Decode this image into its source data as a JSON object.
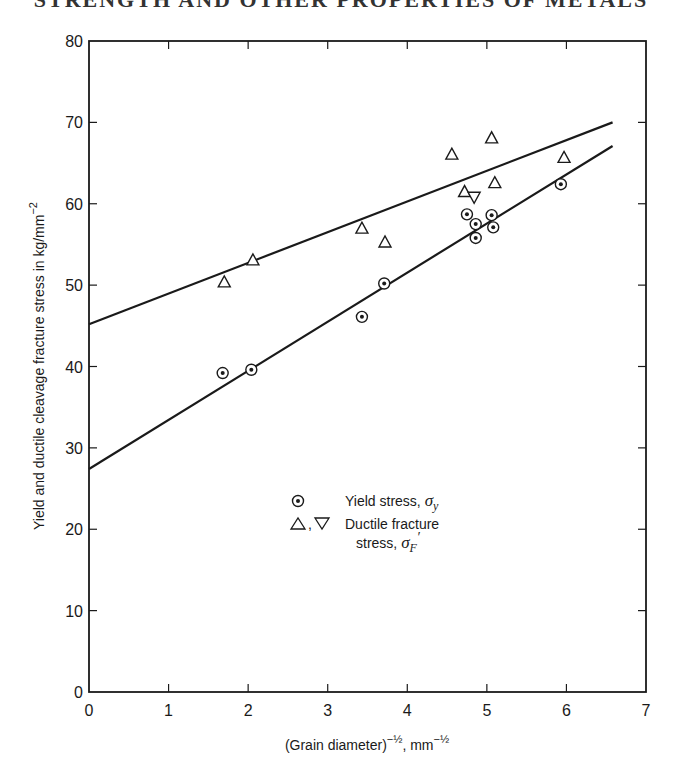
{
  "page": {
    "running_head": "STRENGTH AND OTHER PROPERTIES OF METALS"
  },
  "chart_data": {
    "type": "scatter",
    "title": "",
    "xlabel": "(Grain diameter)⁻½, mm⁻½",
    "xlabel_parts": {
      "main": "(Grain diameter)",
      "sup1": "−½",
      "mid": ", mm",
      "sup2": "−½"
    },
    "ylabel": "Yield and ductile cleavage fracture stress in kg/mm⁻²",
    "ylabel_parts": {
      "main": "Yield and ductile cleavage fracture stress in kg/mm",
      "sup": "−2"
    },
    "xlim": [
      0,
      7
    ],
    "ylim": [
      0,
      80
    ],
    "xticks": [
      0,
      1,
      2,
      3,
      4,
      5,
      6,
      7
    ],
    "yticks": [
      0,
      10,
      20,
      30,
      40,
      50,
      60,
      70,
      80
    ],
    "grid": false,
    "legend": {
      "placement": "center",
      "entries": [
        {
          "marker": "circle-dot",
          "label": "Yield stress, ",
          "symbol": "σ",
          "subscript": "y"
        },
        {
          "marker": "triangle-up,triangle-down",
          "separator": ",",
          "label": "Ductile fracture",
          "label2": "stress, ",
          "symbol": "σ",
          "subscript": "F",
          "prime": "′"
        }
      ]
    },
    "series": [
      {
        "name": "Yield stress, σy",
        "marker": "circle-dot",
        "points": [
          [
            1.68,
            39.2
          ],
          [
            2.04,
            39.6
          ],
          [
            3.43,
            46.1
          ],
          [
            3.71,
            50.2
          ],
          [
            4.75,
            58.7
          ],
          [
            4.86,
            57.5
          ],
          [
            4.86,
            55.8
          ],
          [
            5.06,
            58.6
          ],
          [
            5.08,
            57.1
          ],
          [
            5.93,
            62.4
          ]
        ],
        "fit_line": {
          "x": [
            0,
            6.58
          ],
          "y": [
            27.4,
            67.1
          ]
        }
      },
      {
        "name": "Ductile fracture stress, σF′",
        "marker": "triangle-up",
        "points": [
          [
            1.7,
            50.4
          ],
          [
            2.06,
            53.1
          ],
          [
            3.43,
            57.0
          ],
          [
            3.72,
            55.3
          ],
          [
            4.56,
            66.1
          ],
          [
            4.72,
            61.5
          ],
          [
            5.06,
            68.1
          ],
          [
            5.1,
            62.6
          ],
          [
            5.97,
            65.7
          ]
        ],
        "fit_line": {
          "x": [
            0,
            6.58
          ],
          "y": [
            45.2,
            70.0
          ]
        }
      },
      {
        "name": "Ductile fracture stress, σF′ (inverted)",
        "marker": "triangle-down",
        "points": [
          [
            4.84,
            60.8
          ]
        ]
      }
    ],
    "colors": {
      "ink": "#1a1a1a",
      "background": "#ffffff"
    }
  }
}
